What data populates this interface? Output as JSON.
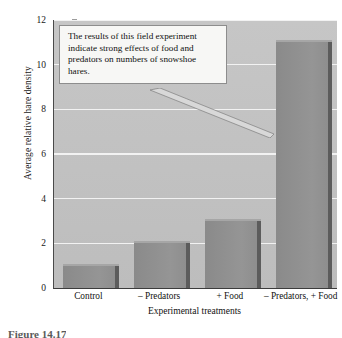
{
  "chart_data": {
    "type": "bar",
    "title": "",
    "xlabel": "Experimental treatments",
    "ylabel": "Average relative hare density",
    "categories": [
      "Control",
      "– Predators",
      "+ Food",
      "– Predators, + Food"
    ],
    "values": [
      1.0,
      2.0,
      3.0,
      11.0
    ],
    "ylim": [
      0,
      12
    ],
    "yticks": [
      0,
      2,
      4,
      6,
      8,
      10,
      12
    ],
    "ytick_labels": [
      "0",
      "2",
      "4",
      "6",
      "8",
      "10",
      "12"
    ],
    "grid": "horizontal",
    "legend": "none",
    "annotations": [
      {
        "name": "callout",
        "text": "The results of this field experiment indicate strong effects of food and predators on numbers of snowshoe hares.",
        "points_to": "– Predators, + Food"
      }
    ],
    "colors": {
      "bar_fill": "#8e8e8e",
      "bar_shadow": "#5c5c5c",
      "plot_background": "#c2c2c2",
      "gridline": "#f2f2f2",
      "axis": "#3c3c3c",
      "callout_background": "#f7f7f5",
      "callout_border": "#8d8d8d",
      "text": "#101010"
    }
  },
  "callout": {
    "line1": "The results of this field experiment",
    "line2": "indicate strong effects of food and",
    "line3": "predators on numbers of snowshoe",
    "line4": "hares."
  },
  "caption": {
    "text": "Figure 14.17"
  }
}
